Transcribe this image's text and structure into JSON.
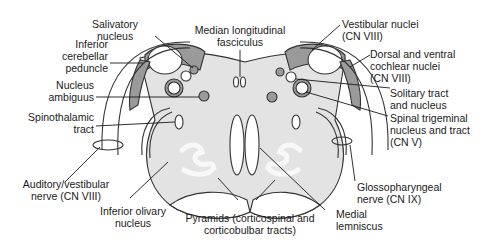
{
  "diagram": {
    "colors": {
      "tissue_fill": "#e3e3e3",
      "nucleus_fill": "#9a9a9a",
      "outline": "#333333",
      "olive_fill": "#f4f4f4"
    },
    "labels": {
      "salivatory": [
        "Salivatory",
        "nucleus"
      ],
      "inferior_cerebellar": [
        "Inferior",
        "cerebellar",
        "peduncle"
      ],
      "nucleus_ambiguus": [
        "Nucleus",
        "ambiguus"
      ],
      "spinothalamic": [
        "Spinothalamic",
        "tract"
      ],
      "auditory_vestibular": [
        "Auditory/vestibular",
        "nerve (CN VIII)"
      ],
      "inferior_olivary": [
        "Inferior olivary",
        "nucleus"
      ],
      "mlf": [
        "Median longitudinal",
        "fasciculus"
      ],
      "pyramids": [
        "Pyramids (corticospinal and",
        "corticobulbar tracts)"
      ],
      "medial_lemniscus": [
        "Medial",
        "lemniscus"
      ],
      "glossopharyngeal": [
        "Glossopharyngeal",
        "nerve (CN IX)"
      ],
      "vestibular_nuclei": [
        "Vestibular nuclei",
        "(CN VIII)"
      ],
      "cochlear_nuclei": [
        "Dorsal and ventral",
        "cochlear nuclei",
        "(CN VIII)"
      ],
      "solitary": [
        "Solitary tract",
        "and nucleus"
      ],
      "spinal_trigeminal": [
        "Spinal trigeminal",
        "nucleus and tract",
        "(CN V)"
      ]
    }
  }
}
